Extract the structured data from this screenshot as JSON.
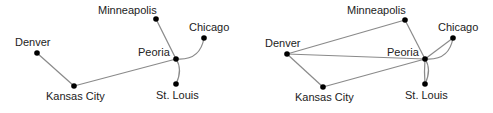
{
  "diagrams": [
    {
      "id": "left",
      "nodes": [
        {
          "key": "denver",
          "label": "Denver"
        },
        {
          "key": "kansas_city",
          "label": "Kansas City"
        },
        {
          "key": "peoria",
          "label": "Peoria"
        },
        {
          "key": "minneapolis",
          "label": "Minneapolis"
        },
        {
          "key": "chicago",
          "label": "Chicago"
        },
        {
          "key": "st_louis",
          "label": "St. Louis"
        }
      ],
      "edges": [
        [
          "denver",
          "kansas_city"
        ],
        [
          "kansas_city",
          "peoria"
        ],
        [
          "minneapolis",
          "peoria"
        ],
        [
          "peoria",
          "chicago"
        ],
        [
          "peoria",
          "st_louis"
        ]
      ]
    },
    {
      "id": "right",
      "nodes": [
        {
          "key": "denver",
          "label": "Denver"
        },
        {
          "key": "kansas_city",
          "label": "Kansas City"
        },
        {
          "key": "peoria",
          "label": "Peoria"
        },
        {
          "key": "minneapolis",
          "label": "Minneapolis"
        },
        {
          "key": "chicago",
          "label": "Chicago"
        },
        {
          "key": "st_louis",
          "label": "St. Louis"
        }
      ],
      "edges": [
        [
          "denver",
          "kansas_city"
        ],
        [
          "kansas_city",
          "peoria"
        ],
        [
          "denver",
          "minneapolis"
        ],
        [
          "denver",
          "peoria"
        ],
        [
          "minneapolis",
          "peoria"
        ],
        [
          "peoria",
          "chicago"
        ],
        [
          "peoria",
          "chicago"
        ],
        [
          "peoria",
          "st_louis"
        ],
        [
          "peoria",
          "st_louis"
        ]
      ]
    }
  ]
}
